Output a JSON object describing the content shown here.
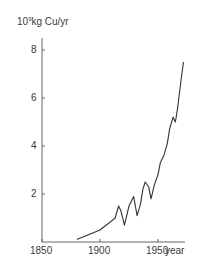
{
  "chart_data": {
    "type": "line",
    "title": "",
    "ylabel": "10^9kg Cu/yr",
    "ylabel_base": "10",
    "ylabel_exp": "9",
    "ylabel_unit": "kg Cu/yr",
    "xlabel": "year",
    "xlim": [
      1850,
      1975
    ],
    "ylim": [
      0,
      8.5
    ],
    "x_ticks": [
      1850,
      1900,
      1950
    ],
    "y_ticks": [
      2,
      4,
      6,
      8
    ],
    "grid": false,
    "legend": null,
    "series": [
      {
        "name": "World copper production",
        "x": [
          1880,
          1890,
          1900,
          1908,
          1913,
          1916,
          1918,
          1921,
          1925,
          1929,
          1932,
          1935,
          1937,
          1939,
          1942,
          1944,
          1947,
          1950,
          1952,
          1955,
          1958,
          1960,
          1963,
          1965,
          1967,
          1970,
          1972
        ],
        "values": [
          0.1,
          0.3,
          0.5,
          0.8,
          1.0,
          1.5,
          1.3,
          0.7,
          1.5,
          1.9,
          1.1,
          1.6,
          2.2,
          2.5,
          2.3,
          1.8,
          2.4,
          2.8,
          3.3,
          3.6,
          4.1,
          4.7,
          5.2,
          5.0,
          5.6,
          6.8,
          7.5
        ]
      }
    ]
  }
}
